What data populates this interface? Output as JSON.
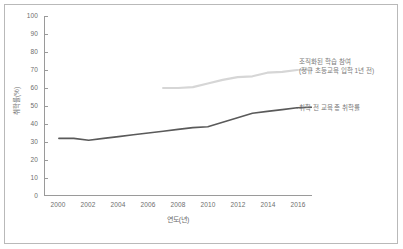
{
  "chart_data": {
    "type": "line",
    "title": "",
    "xlabel": "연도(년)",
    "ylabel": "취학률(%)",
    "xlim": [
      1999,
      2017
    ],
    "ylim": [
      0,
      100
    ],
    "grid": false,
    "legend_position": "inline-annotations",
    "xticks": [
      "2000",
      "2002",
      "2004",
      "2006",
      "2008",
      "2010",
      "2012",
      "2014",
      "2016"
    ],
    "yticks": [
      "0",
      "10",
      "20",
      "30",
      "40",
      "50",
      "60",
      "70",
      "80",
      "90",
      "100"
    ],
    "series": [
      {
        "name": "취학 전 교육 총 취학률",
        "color": "#5a5a5a",
        "annotation_lines": [
          "취학 전 교육 총 취학률"
        ],
        "x": [
          2000,
          2001,
          2002,
          2003,
          2004,
          2005,
          2006,
          2007,
          2008,
          2009,
          2010,
          2011,
          2012,
          2013,
          2014,
          2015,
          2016
        ],
        "values": [
          32,
          32,
          31,
          32,
          33,
          34,
          35,
          36,
          37,
          38,
          38.5,
          41,
          43.5,
          46,
          47,
          48,
          49
        ]
      },
      {
        "name": "조직화된 학습 참여 (정규 초등교육 입학 1년 전)",
        "color": "#d6d6d6",
        "annotation_lines": [
          "조직화된 학습 참여",
          "(정규 초등교육 입학 1년 전)"
        ],
        "x": [
          2007,
          2008,
          2009,
          2010,
          2011,
          2012,
          2013,
          2014,
          2015,
          2016
        ],
        "values": [
          60,
          60,
          60.5,
          62.5,
          64.5,
          66,
          66.5,
          68.5,
          69,
          70
        ]
      }
    ]
  }
}
